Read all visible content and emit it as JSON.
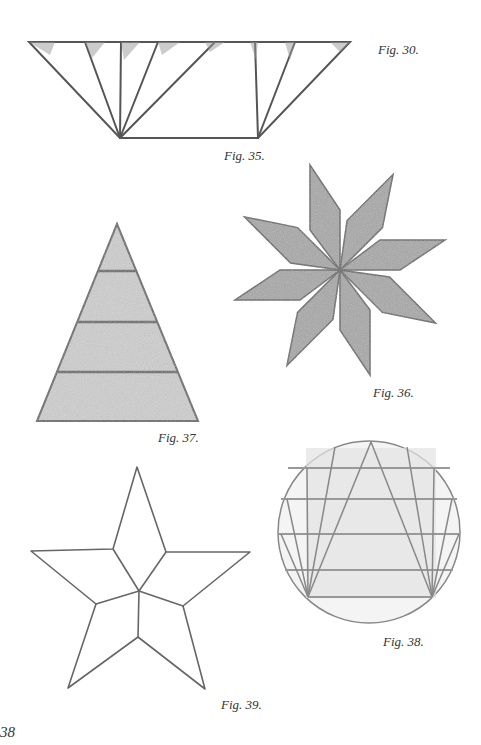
{
  "page": {
    "page_number": "38",
    "captions": {
      "fig30": "Fig. 30.",
      "fig35": "Fig. 35.",
      "fig36": "Fig. 36.",
      "fig37": "Fig. 37.",
      "fig38": "Fig. 38.",
      "fig39": "Fig. 39."
    },
    "figures": [
      {
        "id": "fig35",
        "description": "Inverted trapezoid divided by fan lines from its two bottom corners"
      },
      {
        "id": "fig36",
        "description": "Eight-pointed pinwheel star made of shaded rhombi"
      },
      {
        "id": "fig37",
        "description": "Triangle divided into four horizontal bands, shaded"
      },
      {
        "id": "fig38",
        "description": "Circle containing triangle with horizontal bands and fan lines"
      },
      {
        "id": "fig39",
        "description": "Five-pointed star divided into five kite shapes"
      }
    ],
    "colors": {
      "line": "#555555",
      "shade": "#9a9a9a",
      "paper": "#ffffff"
    }
  }
}
